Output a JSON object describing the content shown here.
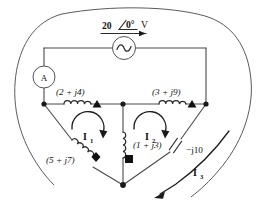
{
  "figure": {
    "name": "ac-mesh-circuit"
  },
  "source": {
    "magnitude": "20",
    "angle_symbol": "∠0°",
    "angle_text": "0°",
    "unit": "V",
    "full_label": "20 ∠0° V",
    "symbol": "ac-source-sine"
  },
  "meter": {
    "label": "A",
    "name": "ammeter"
  },
  "branches": [
    {
      "id": "z1",
      "label": "(2 + j4)",
      "real": "2",
      "imag": "4",
      "symbol": "inductor",
      "marker": "triangle"
    },
    {
      "id": "z2",
      "label": "(3 + j9)",
      "real": "3",
      "imag": "9",
      "symbol": "inductor",
      "marker": "triangle"
    },
    {
      "id": "z3",
      "label": "(5 + j7)",
      "real": "5",
      "imag": "7",
      "symbol": "inductor",
      "marker": "diamond"
    },
    {
      "id": "z4",
      "label": "(1 + j3)",
      "real": "1",
      "imag": "3",
      "symbol": "inductor",
      "marker": "square"
    },
    {
      "id": "z5",
      "label": "−j10",
      "imag": "-10",
      "symbol": "capacitor",
      "marker": "none"
    }
  ],
  "currents": [
    {
      "id": "i1",
      "label": "I",
      "subscript": "1",
      "direction": "clockwise",
      "type": "mesh"
    },
    {
      "id": "i2",
      "label": "I",
      "subscript": "2",
      "direction": "clockwise",
      "type": "mesh"
    },
    {
      "id": "i3",
      "label": "I",
      "subscript": "3",
      "direction": "counterclockwise",
      "type": "supermesh"
    }
  ],
  "colors": {
    "wire": "#4a4a4a",
    "boundary": "#5a5a5a",
    "component": "#2b2b2b",
    "text": "#111111",
    "background": "#ffffff"
  }
}
